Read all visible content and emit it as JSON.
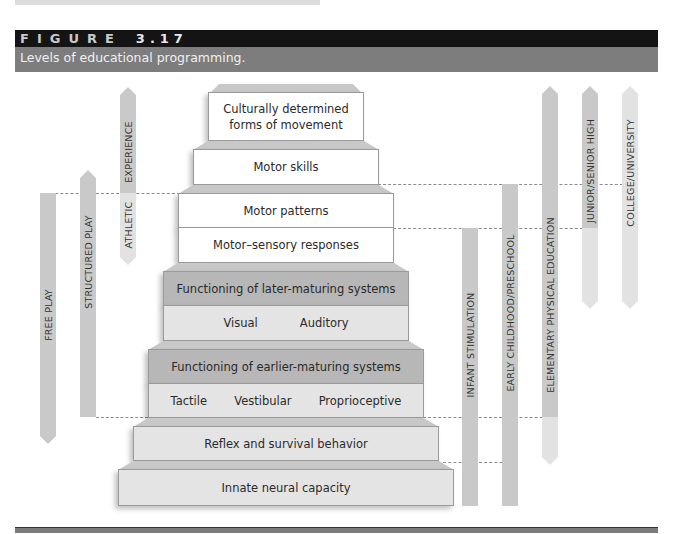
{
  "figure": {
    "label": "FIGURE",
    "number": "3.17",
    "caption": "Levels of educational programming."
  },
  "pyramid": {
    "tiers": [
      {
        "id": "t1",
        "rows": [
          {
            "text": "Culturally determined",
            "text2": "forms of movement",
            "shade": "white"
          }
        ]
      },
      {
        "id": "t2",
        "rows": [
          {
            "text": "Motor skills",
            "shade": "white"
          }
        ]
      },
      {
        "id": "t3",
        "rows": [
          {
            "text": "Motor patterns",
            "shade": "white"
          },
          {
            "text": "Motor–sensory responses",
            "shade": "white"
          }
        ]
      },
      {
        "id": "t4",
        "rows": [
          {
            "text": "Functioning of later-maturing systems",
            "shade": "dark"
          },
          {
            "items": [
              "Visual",
              "Auditory"
            ],
            "shade": "light"
          }
        ]
      },
      {
        "id": "t5",
        "rows": [
          {
            "text": "Functioning of earlier-maturing systems",
            "shade": "dark"
          },
          {
            "items": [
              "Tactile",
              "Vestibular",
              "Proprioceptive"
            ],
            "shade": "light"
          }
        ]
      },
      {
        "id": "t6",
        "rows": [
          {
            "text": "Reflex and survival behavior",
            "shade": "light"
          }
        ]
      },
      {
        "id": "t7",
        "rows": [
          {
            "text": "Innate neural capacity",
            "shade": "light"
          }
        ]
      }
    ]
  },
  "programs_left": [
    {
      "label": "FREE PLAY",
      "top_shape": "flat",
      "bottom_shape": "arrow"
    },
    {
      "label": "STRUCTURED PLAY",
      "top_shape": "arrow",
      "bottom_shape": "flat"
    },
    {
      "label_top": "EXPERIENCE",
      "label_bottom": "ATHLETIC",
      "top_shape": "arrow",
      "bottom_shape": "arrow"
    }
  ],
  "programs_right": [
    {
      "label": "INFANT STIMULATION",
      "top_shape": "flat",
      "bottom_shape": "flat"
    },
    {
      "label": "EARLY CHILDHOOD/PRESCHOOL",
      "top_shape": "flat",
      "bottom_shape": "flat"
    },
    {
      "label": "ELEMENTARY PHYSICAL EDUCATION",
      "top_shape": "arrow",
      "bottom_shape": "arrow"
    },
    {
      "label": "JUNIOR/SENIOR HIGH",
      "top_shape": "arrow",
      "bottom_shape": "arrow"
    },
    {
      "label": "COLLEGE/UNIVERSITY",
      "top_shape": "arrow",
      "bottom_shape": "arrow"
    }
  ],
  "colors": {
    "header_black": "#141414",
    "header_gray": "#7d7d7d",
    "tier_dark": "#b7b7b7",
    "tier_light": "#e4e4e4",
    "arrow_gray": "#c9c9c9",
    "arrow_light": "#e2e2e2"
  }
}
